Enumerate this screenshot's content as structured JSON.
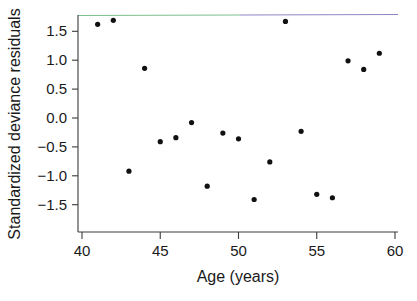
{
  "figure": {
    "background_color": "#ffffff",
    "axis_color": "#3b3b3b",
    "point_color": "#111111"
  },
  "chart_data": {
    "type": "scatter",
    "title": "",
    "xlabel": "Age (years)",
    "ylabel": "Standardized deviance residuals",
    "xlim": [
      40,
      60
    ],
    "ylim": [
      -1.6,
      1.8
    ],
    "grid": false,
    "legend": null,
    "xticks": [
      40,
      45,
      50,
      55,
      60
    ],
    "xtick_labels": [
      "40",
      "45",
      "50",
      "55",
      "60"
    ],
    "yticks": [
      1.5,
      1.0,
      0.5,
      0.0,
      -0.5,
      -1.0,
      -1.5
    ],
    "ytick_labels": [
      "1.5",
      "1.0",
      "0.5",
      "0.0",
      "-0.5",
      "-1.0",
      "-1.5"
    ],
    "x": [
      41,
      42,
      43,
      44,
      45,
      46,
      47,
      48,
      49,
      50,
      51,
      52,
      53,
      54,
      55,
      56,
      57,
      58,
      59
    ],
    "y": [
      1.62,
      1.69,
      -0.92,
      0.86,
      -0.41,
      -0.34,
      -0.08,
      -1.18,
      -0.26,
      -0.36,
      -1.41,
      -0.76,
      1.67,
      -0.23,
      -1.32,
      -1.38,
      0.99,
      0.84,
      1.12
    ],
    "points": [
      {
        "x": 41,
        "y": 1.62
      },
      {
        "x": 42,
        "y": 1.69
      },
      {
        "x": 43,
        "y": -0.92
      },
      {
        "x": 44,
        "y": 0.86
      },
      {
        "x": 45,
        "y": -0.41
      },
      {
        "x": 46,
        "y": -0.34
      },
      {
        "x": 47,
        "y": -0.08
      },
      {
        "x": 48,
        "y": -1.18
      },
      {
        "x": 49,
        "y": -0.26
      },
      {
        "x": 50,
        "y": -0.36
      },
      {
        "x": 51,
        "y": -1.41
      },
      {
        "x": 52,
        "y": -0.76
      },
      {
        "x": 53,
        "y": 1.67
      },
      {
        "x": 54,
        "y": -0.23
      },
      {
        "x": 55,
        "y": -1.32
      },
      {
        "x": 56,
        "y": -1.38
      },
      {
        "x": 57,
        "y": 0.99
      },
      {
        "x": 58,
        "y": 0.84
      },
      {
        "x": 59,
        "y": 1.12
      }
    ]
  }
}
